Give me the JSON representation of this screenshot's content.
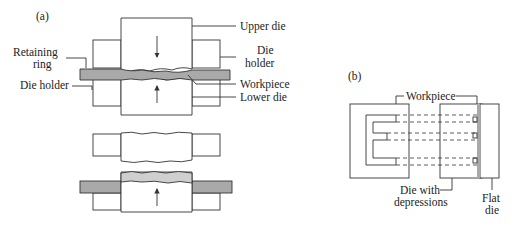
{
  "figure": {
    "panel_a": {
      "label": "(a)",
      "callouts": {
        "upper_die": "Upper die",
        "die_holder_right_1": "Die",
        "die_holder_right_2": "holder",
        "retaining_ring_1": "Retaining",
        "retaining_ring_2": "ring",
        "die_holder_left": "Die holder",
        "workpiece": "Workpiece",
        "lower_die": "Lower die"
      }
    },
    "panel_b": {
      "label": "(b)",
      "callouts": {
        "workpiece": "Workpiece",
        "die_with_depressions_1": "Die with",
        "die_with_depressions_2": "depressions",
        "flat_die_1": "Flat",
        "flat_die_2": "die"
      }
    },
    "colors": {
      "workpiece_fill": "#a9a9a9",
      "line": "#333333",
      "background": "#ffffff"
    }
  }
}
